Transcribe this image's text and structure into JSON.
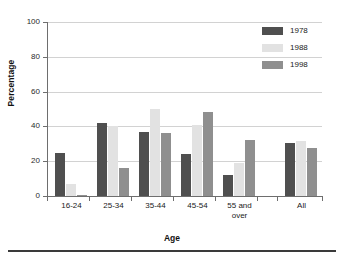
{
  "chart_data": {
    "type": "bar",
    "title": "",
    "xlabel": "Age",
    "ylabel": "Percentage",
    "ylim": [
      0,
      100
    ],
    "yticks": [
      0,
      20,
      40,
      60,
      80,
      100
    ],
    "grid": true,
    "legend_position": "top-right",
    "categories": [
      "16-24",
      "25-34",
      "35-44",
      "45-54",
      "55 and\nover",
      "All"
    ],
    "series": [
      {
        "name": "1978",
        "color": "#4f4f4f",
        "values": [
          25,
          42,
          37,
          24,
          12,
          30.5
        ]
      },
      {
        "name": "1988",
        "color": "#e2e2e2",
        "values": [
          7,
          40,
          50,
          41,
          19,
          31.5
        ]
      },
      {
        "name": "1998",
        "color": "#8f8f8f",
        "values": [
          0.8,
          16,
          36,
          48.5,
          32,
          27.5
        ]
      }
    ]
  }
}
